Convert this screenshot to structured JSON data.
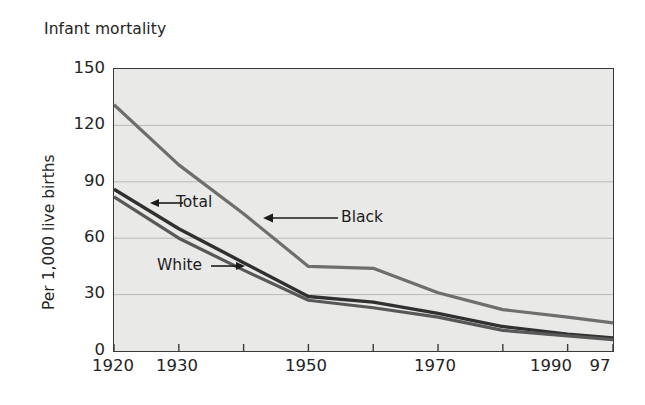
{
  "chart_title": "Infant mortality",
  "axes": {
    "y_title": "Per 1,000 live births",
    "y_ticks": [
      "150",
      "120",
      "90",
      "60",
      "30",
      "0"
    ],
    "x_ticks": [
      "1920",
      "1930",
      "1950",
      "1970",
      "1990",
      "97"
    ]
  },
  "annotations": {
    "total": "Total",
    "white": "White",
    "black": "Black"
  },
  "colors": {
    "plot_background": "#e9e9e7",
    "frame": "#3a3a3a",
    "gridline": "#b9b9b5",
    "series_black": "#6e6e6e",
    "series_total": "#303030",
    "series_white": "#585858",
    "text": "#242424"
  },
  "chart_data": {
    "type": "line",
    "title": "Infant mortality",
    "xlabel": "",
    "ylabel": "Per 1,000 live births",
    "xlim": [
      1920,
      1997
    ],
    "ylim": [
      0,
      150
    ],
    "yticks": [
      0,
      30,
      60,
      90,
      120,
      150
    ],
    "xticks": [
      1920,
      1930,
      1940,
      1950,
      1960,
      1970,
      1980,
      1990,
      1997
    ],
    "xtick_labels": [
      "1920",
      "1930",
      "",
      "1950",
      "",
      "1970",
      "",
      "1990",
      "97"
    ],
    "grid": "horizontal",
    "legend": "inline-annotations",
    "x": [
      1920,
      1930,
      1940,
      1950,
      1960,
      1970,
      1980,
      1990,
      1997
    ],
    "series": [
      {
        "name": "Black",
        "color": "#6e6e6e",
        "values": [
          131,
          99,
          73,
          45,
          44,
          31,
          22,
          18,
          15
        ]
      },
      {
        "name": "Total",
        "color": "#303030",
        "values": [
          86,
          65,
          47,
          29,
          26,
          20,
          13,
          9,
          7
        ]
      },
      {
        "name": "White",
        "color": "#585858",
        "values": [
          82,
          60,
          43,
          27,
          23,
          18,
          11,
          8,
          6
        ]
      }
    ]
  }
}
